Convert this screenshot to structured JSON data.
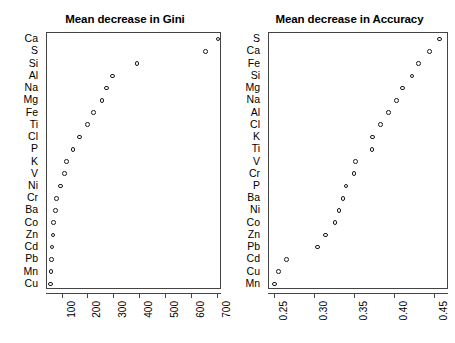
{
  "chart_data": [
    {
      "type": "scatter",
      "title": "Mean decrease in Gini",
      "xlabel": "",
      "ylabel": "",
      "orientation": "horizontal-dotchart",
      "grid": false,
      "legend": null,
      "xlim": [
        40,
        715
      ],
      "xticks": [
        100,
        200,
        300,
        400,
        500,
        600,
        700
      ],
      "xticklabels": [
        "100",
        "200",
        "300",
        "400",
        "500",
        "600",
        "700"
      ],
      "categories": [
        "Ca",
        "S",
        "Si",
        "Al",
        "Na",
        "Mg",
        "Fe",
        "Ti",
        "Cl",
        "P",
        "K",
        "V",
        "Ni",
        "Cr",
        "Ba",
        "Co",
        "Zn",
        "Cd",
        "Pb",
        "Mn",
        "Cu"
      ],
      "values": [
        700,
        652,
        387,
        292,
        269,
        252,
        219,
        196,
        166,
        141,
        115,
        108,
        93,
        76,
        73,
        65,
        63,
        60,
        58,
        56,
        54
      ]
    },
    {
      "type": "scatter",
      "title": "Mean decrease in Accuracy",
      "xlabel": "",
      "ylabel": "",
      "orientation": "horizontal-dotchart",
      "grid": false,
      "legend": null,
      "xlim": [
        0.243,
        0.467
      ],
      "xticks": [
        0.25,
        0.3,
        0.35,
        0.4,
        0.45
      ],
      "xticklabels": [
        "0.25",
        "0.30",
        "0.35",
        "0.40",
        "0.45"
      ],
      "categories": [
        "S",
        "Ca",
        "Fe",
        "Si",
        "Mg",
        "Na",
        "Al",
        "Cl",
        "K",
        "Ti",
        "V",
        "Cr",
        "P",
        "Ba",
        "Ni",
        "Co",
        "Zn",
        "Pb",
        "Cd",
        "Cu",
        "Mn"
      ],
      "values": [
        0.455,
        0.443,
        0.429,
        0.421,
        0.409,
        0.402,
        0.392,
        0.382,
        0.372,
        0.371,
        0.351,
        0.349,
        0.339,
        0.335,
        0.33,
        0.325,
        0.313,
        0.303,
        0.265,
        0.255,
        0.25
      ]
    }
  ]
}
